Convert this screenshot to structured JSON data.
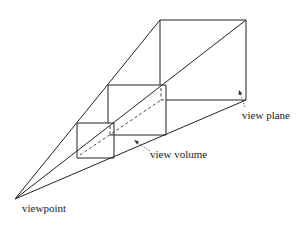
{
  "diagram": {
    "labels": {
      "viewpoint": "viewpoint",
      "view_volume": "view volume",
      "view_plane": "view plane"
    },
    "colors": {
      "line": "#222222",
      "background": "#ffffff"
    },
    "nodes": [
      {
        "id": "viewpoint",
        "label": "viewpoint"
      },
      {
        "id": "near-plane",
        "label": ""
      },
      {
        "id": "middle-plane",
        "label": ""
      },
      {
        "id": "view-plane",
        "label": "view plane"
      }
    ],
    "annotations": [
      {
        "target": "middle-plane",
        "label": "view volume"
      },
      {
        "target": "view-plane",
        "label": "view plane"
      }
    ]
  }
}
